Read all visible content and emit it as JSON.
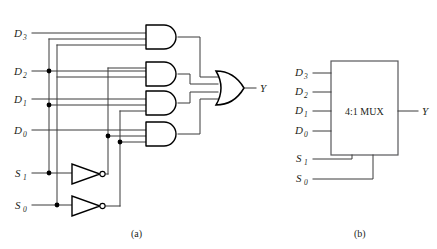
{
  "figure": {
    "panels": [
      {
        "id": "panel-a",
        "caption": "(a)",
        "caption_x": 131,
        "caption_y": 237,
        "description": "gate-level 4:1 multiplexer",
        "inputs": [
          {
            "name": "D3",
            "base": "D",
            "sub": "3",
            "x": 14,
            "y": 37,
            "wire_y": 33
          },
          {
            "name": "D2",
            "base": "D",
            "sub": "2",
            "x": 14,
            "y": 75,
            "wire_y": 71
          },
          {
            "name": "D1",
            "base": "D",
            "sub": "1",
            "x": 14,
            "y": 103,
            "wire_y": 99
          },
          {
            "name": "D0",
            "base": "D",
            "sub": "0",
            "x": 14,
            "y": 134,
            "wire_y": 130
          },
          {
            "name": "S1",
            "base": "S",
            "sub": "1",
            "x": 14,
            "y": 177,
            "wire_y": 173
          },
          {
            "name": "S0",
            "base": "S",
            "sub": "0",
            "x": 14,
            "y": 209,
            "wire_y": 205
          }
        ],
        "output": {
          "name": "Y",
          "base": "Y",
          "sub": "",
          "x": 258,
          "y": 92
        },
        "and_gates": [
          {
            "id": "and-gate-3",
            "x": 146,
            "y": 25,
            "w": 32,
            "h": 24
          },
          {
            "id": "and-gate-2",
            "x": 146,
            "y": 62,
            "w": 32,
            "h": 24
          },
          {
            "id": "and-gate-1",
            "x": 146,
            "y": 91,
            "w": 32,
            "h": 24
          },
          {
            "id": "and-gate-0",
            "x": 146,
            "y": 122,
            "w": 32,
            "h": 24
          }
        ],
        "or_gate": {
          "id": "or-gate",
          "x": 216,
          "y": 71,
          "w": 28,
          "h": 34
        },
        "inverters": [
          {
            "id": "inverter-s1",
            "x": 72,
            "y": 164,
            "w": 28,
            "h": 20
          },
          {
            "id": "inverter-s0",
            "x": 72,
            "y": 196,
            "w": 28,
            "h": 20
          }
        ]
      },
      {
        "id": "panel-b",
        "caption": "(b)",
        "caption_x": 354,
        "caption_y": 237,
        "description": "4:1 MUX block symbol",
        "box_label": "4:1 MUX",
        "box": {
          "x": 331,
          "y": 61,
          "w": 67,
          "h": 94
        },
        "inputs": [
          {
            "name": "D3",
            "base": "D",
            "sub": "3",
            "x": 295,
            "y": 76,
            "wire_y": 73
          },
          {
            "name": "D2",
            "base": "D",
            "sub": "2",
            "x": 295,
            "y": 95,
            "wire_y": 92
          },
          {
            "name": "D1",
            "base": "D",
            "sub": "1",
            "x": 295,
            "y": 114,
            "wire_y": 111
          },
          {
            "name": "D0",
            "base": "D",
            "sub": "0",
            "x": 295,
            "y": 134,
            "wire_y": 131
          },
          {
            "name": "S1",
            "base": "S",
            "sub": "1",
            "x": 295,
            "y": 162,
            "wire_y": 159
          },
          {
            "name": "S0",
            "base": "S",
            "sub": "0",
            "x": 295,
            "y": 182,
            "wire_y": 179
          }
        ],
        "output": {
          "name": "Y",
          "base": "Y",
          "sub": "",
          "x": 424,
          "y": 111
        }
      }
    ],
    "colors": {
      "wire": "#3b3b3b",
      "gate_stroke": "#000000",
      "box_stroke": "#58585b",
      "text": "#231f20",
      "background": "#ffffff"
    }
  }
}
